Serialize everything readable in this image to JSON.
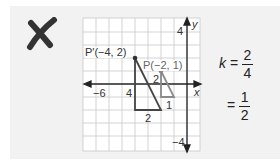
{
  "mark": {
    "icon": "x-mark-icon",
    "color": "#333333"
  },
  "graph": {
    "origin_px": [
      187,
      84
    ],
    "cell_px": 13,
    "x_range": [
      -8,
      1
    ],
    "y_range": [
      -5,
      5
    ],
    "axis_labels": {
      "x": "x",
      "y": "y"
    },
    "tick_labels": {
      "y_top": "4",
      "y_bottom": "−4",
      "x_left": "−6",
      "x_side": "4"
    },
    "points": {
      "p_prime": {
        "label": "P′(−4, 2)",
        "x": -4,
        "y": 2
      },
      "p": {
        "label": "P(−2, 1)",
        "x": -2,
        "y": 1
      }
    },
    "large_triangle": {
      "vertices": [
        [
          -4,
          2
        ],
        [
          -4,
          -2
        ],
        [
          -2,
          -2
        ]
      ],
      "side_labels": {
        "vertical": "4",
        "horizontal": "2"
      },
      "color": "#444444"
    },
    "small_triangle": {
      "vertices": [
        [
          -2,
          1
        ],
        [
          -2,
          -1
        ],
        [
          -1,
          -1
        ]
      ],
      "side_labels": {
        "vertical": "2",
        "horizontal": "1"
      },
      "color": "#8a8a8a"
    }
  },
  "equation": {
    "var": "k",
    "eq1": {
      "num": "2",
      "den": "4"
    },
    "eq2": {
      "num": "1",
      "den": "2"
    },
    "equals": "="
  }
}
